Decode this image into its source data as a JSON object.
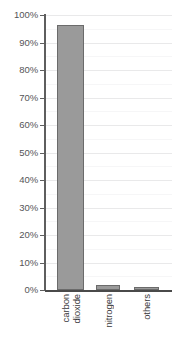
{
  "chart_data": {
    "type": "bar",
    "title": "",
    "subtitle": "",
    "xlabel": "",
    "ylabel": "",
    "categories": [
      "carbon dioxide",
      "nitrogen",
      "others"
    ],
    "category_lines": [
      [
        "carbon",
        "dioxide"
      ],
      [
        "nitrogen"
      ],
      [
        "others"
      ]
    ],
    "values": [
      96.5,
      2,
      1
    ],
    "value_labels": [
      "96.5%",
      "2%",
      "1%"
    ],
    "ylim": [
      0,
      100
    ],
    "y_tick_values": [
      0,
      10,
      20,
      30,
      40,
      50,
      60,
      70,
      80,
      90,
      100
    ],
    "y_tick_labels": [
      "0%",
      "10%",
      "20%",
      "30%",
      "40%",
      "50%",
      "60%",
      "70%",
      "80%",
      "90%",
      "100%"
    ],
    "y_minor_tick_values": [
      5,
      15,
      25,
      35,
      45,
      55,
      65,
      75,
      85,
      95
    ],
    "grid": true,
    "grid_axis": "y",
    "legend": false,
    "legend_position": "none",
    "annotations": [],
    "colors": {
      "background": "#ffffff",
      "bar_fill": "#9a9a9a",
      "bar_border": "#6b6b6b",
      "gridline_major": "#e9e9ea",
      "gridline_minor": "#f6f6f7",
      "axis_line": "#5e5e5e",
      "tick_label": "#555557",
      "category_label": "#39393b"
    }
  }
}
